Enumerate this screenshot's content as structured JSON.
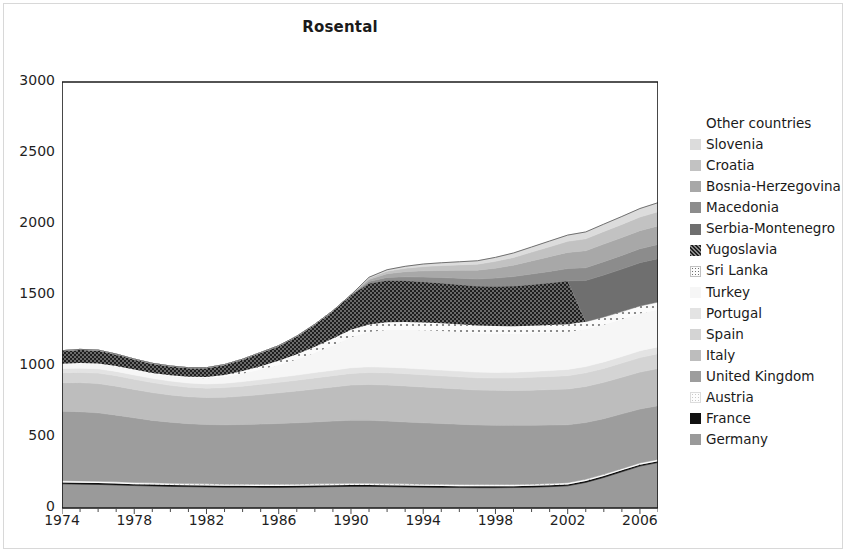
{
  "chart_data": {
    "type": "area",
    "title": "Rosental",
    "subtitle": "",
    "xlabel": "",
    "ylabel": "",
    "stacked": true,
    "grid": false,
    "legend_position": "right",
    "xlim": [
      1974,
      2007
    ],
    "ylim": [
      0,
      3000
    ],
    "y_ticks": [
      0,
      500,
      1000,
      1500,
      2000,
      2500,
      3000
    ],
    "x_ticks": [
      1974,
      1978,
      1982,
      1986,
      1990,
      1994,
      1998,
      2002,
      2006
    ],
    "x_minor_tick_interval": 1,
    "x": [
      1974,
      1975,
      1976,
      1977,
      1978,
      1979,
      1980,
      1981,
      1982,
      1983,
      1984,
      1985,
      1986,
      1987,
      1988,
      1989,
      1990,
      1991,
      1992,
      1993,
      1994,
      1995,
      1996,
      1997,
      1998,
      1999,
      2000,
      2001,
      2002,
      2003,
      2004,
      2005,
      2006,
      2007
    ],
    "series": [
      {
        "name": "Germany",
        "fill": "#9a9a9a",
        "pattern": "solid",
        "values": [
          170,
          168,
          166,
          162,
          158,
          155,
          152,
          150,
          148,
          146,
          146,
          145,
          145,
          146,
          148,
          150,
          152,
          152,
          150,
          148,
          146,
          145,
          144,
          143,
          143,
          144,
          146,
          150,
          156,
          180,
          215,
          255,
          295,
          320
        ]
      },
      {
        "name": "France",
        "fill": "#111111",
        "pattern": "solid",
        "values": [
          10,
          10,
          10,
          10,
          10,
          10,
          10,
          10,
          10,
          10,
          10,
          10,
          10,
          10,
          10,
          10,
          10,
          10,
          10,
          10,
          10,
          10,
          10,
          10,
          10,
          10,
          10,
          10,
          10,
          10,
          10,
          10,
          10,
          10
        ]
      },
      {
        "name": "Austria",
        "fill": "#fbfbfb",
        "pattern": "dots-light",
        "values": [
          12,
          12,
          12,
          12,
          12,
          12,
          12,
          12,
          12,
          12,
          12,
          12,
          12,
          12,
          12,
          12,
          12,
          12,
          12,
          12,
          12,
          12,
          12,
          12,
          12,
          12,
          12,
          12,
          12,
          12,
          12,
          12,
          12,
          12
        ]
      },
      {
        "name": "United Kingdom",
        "fill": "#9d9d9d",
        "pattern": "solid",
        "values": [
          490,
          488,
          482,
          470,
          455,
          440,
          430,
          422,
          418,
          418,
          420,
          424,
          428,
          432,
          436,
          440,
          444,
          444,
          440,
          436,
          432,
          428,
          424,
          420,
          418,
          416,
          414,
          412,
          408,
          400,
          392,
          386,
          380,
          378
        ]
      },
      {
        "name": "Italy",
        "fill": "#bdbdbd",
        "pattern": "solid",
        "values": [
          200,
          205,
          206,
          204,
          200,
          196,
          192,
          190,
          190,
          194,
          200,
          208,
          216,
          224,
          232,
          240,
          248,
          252,
          254,
          254,
          252,
          250,
          248,
          246,
          246,
          246,
          248,
          250,
          252,
          254,
          256,
          258,
          260,
          262
        ]
      },
      {
        "name": "Spain",
        "fill": "#d4d4d4",
        "pattern": "solid",
        "values": [
          70,
          72,
          74,
          74,
          72,
          70,
          68,
          66,
          66,
          68,
          70,
          72,
          74,
          76,
          78,
          80,
          82,
          84,
          86,
          86,
          86,
          86,
          86,
          86,
          86,
          88,
          90,
          92,
          94,
          96,
          98,
          100,
          102,
          104
        ]
      },
      {
        "name": "Portugal",
        "fill": "#e3e3e3",
        "pattern": "solid",
        "values": [
          30,
          30,
          30,
          30,
          30,
          30,
          30,
          30,
          30,
          30,
          32,
          34,
          36,
          36,
          38,
          38,
          40,
          40,
          40,
          40,
          40,
          40,
          40,
          40,
          40,
          40,
          42,
          42,
          44,
          44,
          46,
          46,
          48,
          48
        ]
      },
      {
        "name": "Turkey",
        "fill": "#f6f6f6",
        "pattern": "solid",
        "values": [
          30,
          32,
          34,
          34,
          34,
          34,
          36,
          38,
          40,
          46,
          56,
          70,
          86,
          110,
          140,
          175,
          215,
          245,
          262,
          270,
          274,
          276,
          276,
          274,
          272,
          270,
          268,
          266,
          264,
          262,
          262,
          262,
          262,
          262
        ]
      },
      {
        "name": "Sri Lanka",
        "fill": "#fafafa",
        "pattern": "dots-sparse",
        "values": [
          4,
          4,
          4,
          4,
          4,
          4,
          4,
          6,
          8,
          12,
          18,
          24,
          30,
          36,
          42,
          48,
          52,
          54,
          54,
          54,
          54,
          54,
          54,
          54,
          54,
          54,
          54,
          54,
          54,
          54,
          54,
          54,
          54,
          54
        ]
      },
      {
        "name": "Yugoslavia",
        "fill": "#3a3a3a",
        "pattern": "crosshatch",
        "values": [
          92,
          96,
          94,
          84,
          74,
          68,
          66,
          64,
          66,
          74,
          84,
          96,
          106,
          128,
          158,
          196,
          246,
          290,
          296,
          292,
          288,
          284,
          280,
          278,
          280,
          284,
          290,
          298,
          306,
          0,
          0,
          0,
          0,
          0
        ]
      },
      {
        "name": "Serbia-Montenegro",
        "fill": "#6f6f6f",
        "pattern": "solid",
        "values": [
          0,
          0,
          0,
          0,
          0,
          0,
          0,
          0,
          0,
          0,
          0,
          0,
          0,
          0,
          0,
          0,
          0,
          0,
          0,
          0,
          0,
          0,
          0,
          0,
          0,
          0,
          0,
          0,
          0,
          290,
          296,
          300,
          304,
          306
        ]
      },
      {
        "name": "Macedonia",
        "fill": "#8c8c8c",
        "pattern": "solid",
        "values": [
          0,
          0,
          0,
          0,
          0,
          0,
          0,
          0,
          0,
          0,
          0,
          0,
          0,
          0,
          0,
          0,
          0,
          12,
          20,
          26,
          32,
          38,
          44,
          50,
          58,
          66,
          74,
          80,
          86,
          90,
          94,
          96,
          98,
          100
        ]
      },
      {
        "name": "Bosnia-Herzegovina",
        "fill": "#a8a8a8",
        "pattern": "solid",
        "values": [
          0,
          0,
          0,
          0,
          0,
          0,
          0,
          0,
          0,
          0,
          0,
          0,
          0,
          0,
          0,
          0,
          0,
          14,
          26,
          36,
          44,
          50,
          56,
          62,
          70,
          80,
          92,
          104,
          114,
          120,
          124,
          126,
          128,
          130
        ]
      },
      {
        "name": "Croatia",
        "fill": "#c2c2c2",
        "pattern": "solid",
        "values": [
          0,
          0,
          0,
          0,
          0,
          0,
          0,
          0,
          0,
          0,
          0,
          0,
          0,
          0,
          0,
          0,
          0,
          10,
          18,
          24,
          30,
          34,
          38,
          42,
          48,
          54,
          62,
          70,
          78,
          84,
          88,
          92,
          96,
          100
        ]
      },
      {
        "name": "Slovenia",
        "fill": "#dcdcdc",
        "pattern": "solid",
        "values": [
          0,
          0,
          0,
          0,
          0,
          0,
          0,
          0,
          0,
          0,
          0,
          0,
          0,
          0,
          0,
          0,
          0,
          6,
          10,
          14,
          18,
          20,
          22,
          24,
          28,
          32,
          36,
          40,
          44,
          48,
          52,
          56,
          60,
          64
        ]
      },
      {
        "name": "Other countries",
        "fill": "#ffffff",
        "pattern": "none",
        "values": [
          0,
          0,
          0,
          0,
          0,
          0,
          0,
          0,
          0,
          0,
          0,
          0,
          0,
          0,
          0,
          0,
          0,
          0,
          0,
          0,
          0,
          0,
          0,
          0,
          0,
          0,
          0,
          0,
          0,
          0,
          0,
          0,
          0,
          0
        ]
      }
    ],
    "totals": [
      1108,
      1117,
      1112,
      1084,
      1049,
      1019,
      1000,
      988,
      984,
      1004,
      1048,
      1099,
      1149,
      1226,
      1334,
      1449,
      1551,
      1613,
      1678,
      1680,
      1678,
      1675,
      1672,
      1669,
      1685,
      1704,
      1738,
      1778,
      1820,
      1832,
      1905,
      1959,
      2017,
      2126
    ]
  },
  "legend": {
    "entries": [
      {
        "label": "Other countries",
        "swatch": "none"
      },
      {
        "label": "Slovenia",
        "swatch": "solid"
      },
      {
        "label": "Croatia",
        "swatch": "solid"
      },
      {
        "label": "Bosnia-Herzegovina",
        "swatch": "solid"
      },
      {
        "label": "Macedonia",
        "swatch": "solid"
      },
      {
        "label": "Serbia-Montenegro",
        "swatch": "solid"
      },
      {
        "label": "Yugoslavia",
        "swatch": "crosshatch"
      },
      {
        "label": "Sri Lanka",
        "swatch": "dots-sparse"
      },
      {
        "label": "Turkey",
        "swatch": "solid"
      },
      {
        "label": "Portugal",
        "swatch": "solid"
      },
      {
        "label": "Spain",
        "swatch": "solid"
      },
      {
        "label": "Italy",
        "swatch": "solid"
      },
      {
        "label": "United Kingdom",
        "swatch": "solid"
      },
      {
        "label": "Austria",
        "swatch": "dots-light"
      },
      {
        "label": "France",
        "swatch": "solid"
      },
      {
        "label": "Germany",
        "swatch": "solid"
      }
    ]
  },
  "axis_colors": {
    "axis_line": "#1a1a1a",
    "text": "#1f1f1f"
  }
}
